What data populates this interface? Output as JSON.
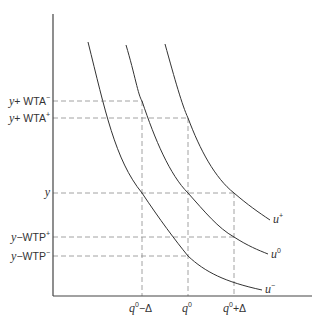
{
  "diagram": {
    "type": "indifference-curves",
    "axes": {
      "x_axis": {
        "label": ""
      },
      "y_axis": {
        "label": ""
      }
    },
    "y_labels": [
      {
        "id": "y_plus_wta_minus",
        "base": "y",
        "op": "+",
        "term": "WTA",
        "sup": "−",
        "py": 101
      },
      {
        "id": "y_plus_wta_plus",
        "base": "y",
        "op": "+",
        "term": "WTA",
        "sup": "+",
        "py": 118
      },
      {
        "id": "y",
        "base": "y",
        "op": "",
        "term": "",
        "sup": "",
        "py": 193
      },
      {
        "id": "y_minus_wtp_plus",
        "base": "y",
        "op": "−",
        "term": "WTP",
        "sup": "+",
        "py": 237
      },
      {
        "id": "y_minus_wtp_minus",
        "base": "y",
        "op": "−",
        "term": "WTP",
        "sup": "−",
        "py": 256
      }
    ],
    "x_labels": [
      {
        "id": "q0_minus_delta",
        "base": "q",
        "sup": "0",
        "suffix": "−Δ",
        "px": 142
      },
      {
        "id": "q0",
        "base": "q",
        "sup": "0",
        "suffix": "",
        "px": 188
      },
      {
        "id": "q0_plus_delta",
        "base": "q",
        "sup": "0",
        "suffix": "+Δ",
        "px": 234
      }
    ],
    "curves": [
      {
        "id": "u_minus",
        "label_base": "u",
        "label_sup": "−"
      },
      {
        "id": "u_zero",
        "label_base": "u",
        "label_sup": "0"
      },
      {
        "id": "u_plus",
        "label_base": "u",
        "label_sup": "+"
      }
    ],
    "colors": {
      "curve": "#333333",
      "axis": "#444444",
      "dash": "#888888",
      "text": "#333333"
    }
  }
}
